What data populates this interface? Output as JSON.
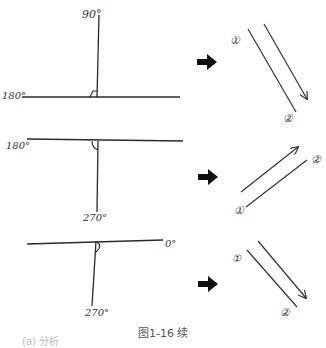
{
  "figure": {
    "caption": "图1-16 续",
    "partial_subcaption": "(a) 分析",
    "rows": [
      {
        "axes": {
          "vertical_label": "90°",
          "horizontal_label": "180°",
          "angle_mark": "right-angle"
        },
        "arrow": "right-arrow",
        "result": {
          "start_label": "①",
          "end_label": "②",
          "direction": "down-right"
        }
      },
      {
        "axes": {
          "horizontal_label": "180°",
          "vertical_label": "270°",
          "angle_mark": "right-angle"
        },
        "arrow": "right-arrow",
        "result": {
          "start_label": "①",
          "end_label": "②",
          "direction": "up-right"
        }
      },
      {
        "axes": {
          "horizontal_label": "0°",
          "vertical_label": "270°",
          "angle_mark": "right-angle"
        },
        "arrow": "right-arrow",
        "result": {
          "start_label": "①",
          "end_label": "②",
          "direction": "down-right"
        }
      }
    ]
  },
  "colors": {
    "ink": "#2a2a2a",
    "arrow_fill": "#111111",
    "caption": "#555555"
  }
}
